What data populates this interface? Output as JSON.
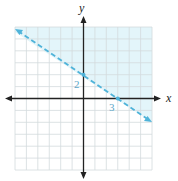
{
  "graph": {
    "x_axis_label": "x",
    "y_axis_label": "y",
    "y_intercept_label": "2",
    "x_intercept_label": "3",
    "grid": {
      "x_min": -6,
      "x_max": 6,
      "y_min": -6,
      "y_max": 6,
      "step": 1
    },
    "boundary_line": {
      "style": "dashed",
      "points": [
        [
          0,
          2
        ],
        [
          3,
          0
        ]
      ],
      "equation": "2x + 3y = 6"
    },
    "shaded_region": "above line (2x + 3y > 6)",
    "colors": {
      "line": "#4fb3d9",
      "shade": "#e3f5fa",
      "grid": "#cfd8dc",
      "axis": "#222222",
      "labels": "#5aa6c8"
    }
  }
}
